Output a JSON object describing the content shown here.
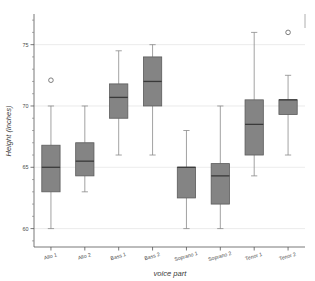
{
  "chart_data": {
    "type": "box",
    "title": "",
    "xlabel": "voice part",
    "ylabel": "Height (inches)",
    "categories": [
      "Alto 1",
      "Alto 2",
      "Bass 1",
      "Bass 2",
      "Soprano 1",
      "Soprano 2",
      "Tenor 1",
      "Tenor 2"
    ],
    "ylim": [
      58.5,
      77.5
    ],
    "yticks": [
      60,
      65,
      70,
      75
    ],
    "ytick_labels": [
      "60",
      "65",
      "70",
      "75"
    ],
    "yminor_step": 1,
    "grid": true,
    "grid_axis": "y",
    "legend": "none",
    "boxes": [
      {
        "category": "Alto 1",
        "whisker_low": 60.0,
        "q1": 63.0,
        "median": 65.0,
        "q3": 66.8,
        "whisker_high": 70.0,
        "outliers": [
          72.1
        ]
      },
      {
        "category": "Alto 2",
        "whisker_low": 63.0,
        "q1": 64.3,
        "median": 65.5,
        "q3": 67.0,
        "whisker_high": 70.0,
        "outliers": []
      },
      {
        "category": "Bass 1",
        "whisker_low": 66.0,
        "q1": 69.0,
        "median": 70.7,
        "q3": 71.8,
        "whisker_high": 74.5,
        "outliers": []
      },
      {
        "category": "Bass 2",
        "whisker_low": 66.0,
        "q1": 70.0,
        "median": 72.0,
        "q3": 74.0,
        "whisker_high": 75.0,
        "outliers": []
      },
      {
        "category": "Soprano 1",
        "whisker_low": 60.0,
        "q1": 62.5,
        "median": 65.0,
        "q3": 65.0,
        "whisker_high": 68.0,
        "outliers": []
      },
      {
        "category": "Soprano 2",
        "whisker_low": 60.0,
        "q1": 62.0,
        "median": 64.3,
        "q3": 65.3,
        "whisker_high": 70.0,
        "outliers": []
      },
      {
        "category": "Tenor 1",
        "whisker_low": 64.3,
        "q1": 66.0,
        "median": 68.5,
        "q3": 70.5,
        "whisker_high": 76.0,
        "outliers": []
      },
      {
        "category": "Tenor 2",
        "whisker_low": 66.0,
        "q1": 69.3,
        "median": 70.5,
        "q3": 70.5,
        "whisker_high": 72.5,
        "outliers": [
          76.0
        ]
      }
    ]
  },
  "colors": {
    "box_fill": "#848484",
    "box_edge": "#5b5b5b",
    "median": "#3a3a3a",
    "whisker": "#8a8a8a",
    "grid": "#e2e2e2",
    "axis": "#555555",
    "text": "#4a4a4a",
    "background": "#ffffff"
  }
}
